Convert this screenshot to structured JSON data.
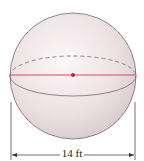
{
  "figure": {
    "shape": "sphere",
    "diameter_label": "14 ft",
    "colors": {
      "sphere_fill_light": "#f7f1f2",
      "sphere_fill_dark": "#d9cdd0",
      "outline": "#6b5a5e",
      "diameter_line": "#d94a5a",
      "center_dot": "#c0283a",
      "dimension_line": "#333333"
    }
  }
}
